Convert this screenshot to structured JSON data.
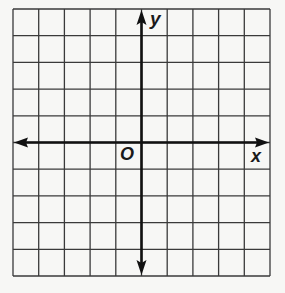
{
  "figure": {
    "type": "coordinate-plane",
    "grid": {
      "columns": 10,
      "rows": 10,
      "left": 13,
      "top": 9,
      "right": 270,
      "bottom": 276,
      "line_color": "#3a3a3a",
      "axis_color": "#111111"
    },
    "labels": {
      "x_axis": "x",
      "y_axis": "y",
      "origin": "O"
    },
    "axes": {
      "x_arrows": "both",
      "y_arrows": "both"
    }
  }
}
